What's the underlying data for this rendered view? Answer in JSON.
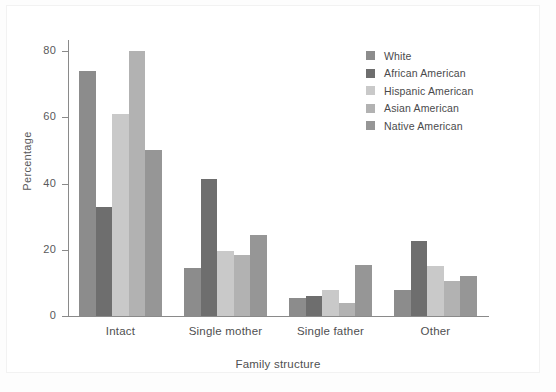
{
  "chart_data": {
    "type": "bar",
    "title": "",
    "subtitle": "",
    "xlabel": "Family structure",
    "ylabel": "Percentage",
    "categories": [
      "Intact",
      "Single mother",
      "Single father",
      "Other"
    ],
    "series": [
      {
        "name": "White",
        "color": "#8c8c8c",
        "values": [
          74,
          14.5,
          5.5,
          8
        ]
      },
      {
        "name": "African American",
        "color": "#6e6e6e",
        "values": [
          33,
          41.5,
          6,
          22.5
        ]
      },
      {
        "name": "Hispanic American",
        "color": "#c9c9c9",
        "values": [
          61,
          19.5,
          8,
          15
        ]
      },
      {
        "name": "Asian American",
        "color": "#b2b2b2",
        "values": [
          80,
          18.5,
          4,
          10.5
        ]
      },
      {
        "name": "Native American",
        "color": "#969696",
        "values": [
          50,
          24.5,
          15.5,
          12
        ]
      }
    ],
    "ylim": [
      0,
      80
    ],
    "yticks": [
      "0",
      "20",
      "40",
      "60",
      "80"
    ],
    "ytick_values": [
      0,
      20,
      40,
      60,
      80
    ],
    "grid": false,
    "legend_position": "top-right",
    "legend_entries": [
      "White",
      "African American",
      "Hispanic American",
      "Asian American",
      "Native American"
    ]
  }
}
